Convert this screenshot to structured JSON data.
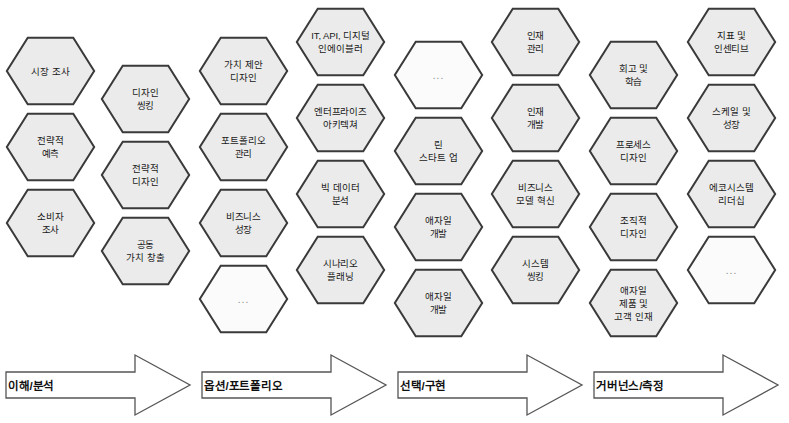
{
  "diagram": {
    "hex_fill": "#ebebeb",
    "hex_fill_empty": "#fbfbfb",
    "hex_stroke": "#3a3a3a",
    "arrow_stroke": "#555555",
    "arrow_fill": "#ffffff",
    "ellipsis_text": "..."
  },
  "columns": [
    {
      "id": "col-1",
      "hexes": [
        {
          "label": "시장 조사",
          "empty": false,
          "x": 5,
          "y": 36,
          "w": 91,
          "h": 70
        },
        {
          "label": "전략적\n예측",
          "empty": false,
          "x": 5,
          "y": 112,
          "w": 91,
          "h": 70
        },
        {
          "label": "소비자\n조사",
          "empty": false,
          "x": 5,
          "y": 188,
          "w": 91,
          "h": 70
        }
      ]
    },
    {
      "id": "col-2",
      "hexes": [
        {
          "label": "디자인\n씽킹",
          "empty": false,
          "x": 100,
          "y": 64,
          "w": 91,
          "h": 70
        },
        {
          "label": "전략적\n디자인",
          "empty": false,
          "x": 100,
          "y": 140,
          "w": 91,
          "h": 70
        },
        {
          "label": "공동\n가치 창출",
          "empty": false,
          "x": 100,
          "y": 216,
          "w": 91,
          "h": 70
        }
      ]
    },
    {
      "id": "col-3",
      "hexes": [
        {
          "label": "가치 제안\n디자인",
          "empty": false,
          "x": 198,
          "y": 36,
          "w": 91,
          "h": 70
        },
        {
          "label": "포트폴리오\n관리",
          "empty": false,
          "x": 198,
          "y": 112,
          "w": 91,
          "h": 70
        },
        {
          "label": "비즈니스\n성장",
          "empty": false,
          "x": 198,
          "y": 188,
          "w": 91,
          "h": 70
        },
        {
          "label": "...",
          "empty": true,
          "x": 198,
          "y": 264,
          "w": 91,
          "h": 70
        }
      ]
    },
    {
      "id": "col-4",
      "hexes": [
        {
          "label": "IT, API, 디지털\n인에이블러",
          "empty": false,
          "x": 295,
          "y": 7,
          "w": 91,
          "h": 70
        },
        {
          "label": "엔터프라이즈\n아키텍쳐",
          "empty": false,
          "x": 295,
          "y": 83,
          "w": 91,
          "h": 70
        },
        {
          "label": "빅 데이터\n분석",
          "empty": false,
          "x": 295,
          "y": 159,
          "w": 91,
          "h": 70
        },
        {
          "label": "시나리오\n플래닝",
          "empty": false,
          "x": 295,
          "y": 235,
          "w": 91,
          "h": 70
        }
      ]
    },
    {
      "id": "col-5",
      "hexes": [
        {
          "label": "...",
          "empty": true,
          "x": 393,
          "y": 40,
          "w": 91,
          "h": 70
        },
        {
          "label": "린\n스타트 업",
          "empty": false,
          "x": 393,
          "y": 116,
          "w": 91,
          "h": 70
        },
        {
          "label": "애자일\n개발",
          "empty": false,
          "x": 393,
          "y": 192,
          "w": 91,
          "h": 70
        },
        {
          "label": "애자일\n개발",
          "empty": false,
          "x": 393,
          "y": 268,
          "w": 91,
          "h": 70
        }
      ]
    },
    {
      "id": "col-6",
      "hexes": [
        {
          "label": "인재\n관리",
          "empty": false,
          "x": 490,
          "y": 7,
          "w": 91,
          "h": 70
        },
        {
          "label": "인재\n개발",
          "empty": false,
          "x": 490,
          "y": 83,
          "w": 91,
          "h": 70
        },
        {
          "label": "비즈니스\n모델 혁신",
          "empty": false,
          "x": 490,
          "y": 159,
          "w": 91,
          "h": 70
        },
        {
          "label": "시스템\n씽킹",
          "empty": false,
          "x": 490,
          "y": 235,
          "w": 91,
          "h": 70
        }
      ]
    },
    {
      "id": "col-7",
      "hexes": [
        {
          "label": "회고 및\n학습",
          "empty": false,
          "x": 588,
          "y": 40,
          "w": 91,
          "h": 70
        },
        {
          "label": "프로세스\n디자인",
          "empty": false,
          "x": 588,
          "y": 116,
          "w": 91,
          "h": 70
        },
        {
          "label": "조직적\n디자인",
          "empty": false,
          "x": 588,
          "y": 192,
          "w": 91,
          "h": 70
        },
        {
          "label": "애자일\n제품 및\n고객 인재",
          "empty": false,
          "x": 588,
          "y": 268,
          "w": 91,
          "h": 70
        }
      ]
    },
    {
      "id": "col-8",
      "hexes": [
        {
          "label": "지표 및\n인센티브",
          "empty": false,
          "x": 686,
          "y": 7,
          "w": 91,
          "h": 70
        },
        {
          "label": "스케일 및\n성장",
          "empty": false,
          "x": 686,
          "y": 83,
          "w": 91,
          "h": 70
        },
        {
          "label": "에코시스템\n리더십",
          "empty": false,
          "x": 686,
          "y": 159,
          "w": 91,
          "h": 70
        },
        {
          "label": "...",
          "empty": true,
          "x": 686,
          "y": 235,
          "w": 91,
          "h": 70
        }
      ]
    }
  ],
  "arrows": [
    {
      "id": "arrow-1",
      "label": "이해/분석",
      "x": 4,
      "y": 352,
      "w": 188,
      "h": 66
    },
    {
      "id": "arrow-2",
      "label": "옵션/포트폴리오",
      "x": 200,
      "y": 352,
      "w": 188,
      "h": 66
    },
    {
      "id": "arrow-3",
      "label": "선택/구현",
      "x": 396,
      "y": 352,
      "w": 188,
      "h": 66
    },
    {
      "id": "arrow-4",
      "label": "거버넌스/측정",
      "x": 592,
      "y": 352,
      "w": 188,
      "h": 66
    }
  ]
}
